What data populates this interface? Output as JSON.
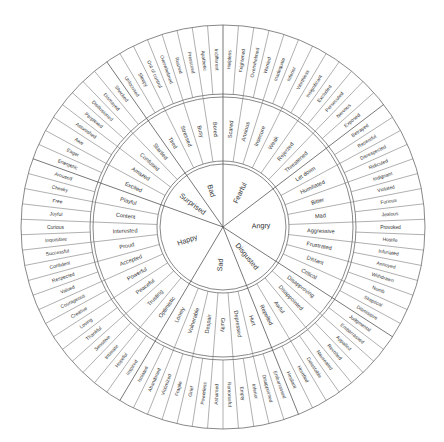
{
  "diagram": {
    "geometry": {
      "cx": 223,
      "cy": 227,
      "r_core": 63,
      "r_mid_inner": 66,
      "r_mid": 130,
      "r_out_inner": 133,
      "r_out": 202,
      "start_angle_deg": -90
    },
    "colors": {
      "line": "#6a6a6a",
      "text": "#333333",
      "background": "#ffffff"
    },
    "core": [
      {
        "label": "Fearful",
        "secondary": [
          {
            "label": "Scared",
            "tertiary": [
              "Helpless",
              "Frightened"
            ]
          },
          {
            "label": "Anxious",
            "tertiary": [
              "Overwhelmed",
              "Worried"
            ]
          },
          {
            "label": "Insecure",
            "tertiary": [
              "Inadequate",
              "Inferior"
            ]
          },
          {
            "label": "Weak",
            "tertiary": [
              "Worthless",
              "Insignificant"
            ]
          },
          {
            "label": "Rejected",
            "tertiary": [
              "Excluded",
              "Persecuted"
            ]
          },
          {
            "label": "Threatened",
            "tertiary": [
              "Nervous",
              "Exposed"
            ]
          }
        ]
      },
      {
        "label": "Angry",
        "secondary": [
          {
            "label": "Let down",
            "tertiary": [
              "Betrayed",
              "Resentful"
            ]
          },
          {
            "label": "Humiliated",
            "tertiary": [
              "Disrespected",
              "Ridiculed"
            ]
          },
          {
            "label": "Bitter",
            "tertiary": [
              "Indignant",
              "Violated"
            ]
          },
          {
            "label": "Mad",
            "tertiary": [
              "Furious",
              "Jealous"
            ]
          },
          {
            "label": "Aggressive",
            "tertiary": [
              "Provoked",
              "Hostile"
            ]
          },
          {
            "label": "Frustrated",
            "tertiary": [
              "Infuriated",
              "Annoyed"
            ]
          },
          {
            "label": "Distant",
            "tertiary": [
              "Withdrawn",
              "Numb"
            ]
          },
          {
            "label": "Critical",
            "tertiary": [
              "Skeptical",
              "Dismissive"
            ]
          }
        ]
      },
      {
        "label": "Disgusted",
        "secondary": [
          {
            "label": "Disapproving",
            "tertiary": [
              "Judgmental",
              "Embarrassed"
            ]
          },
          {
            "label": "Disappointed",
            "tertiary": [
              "Appalled",
              "Revolted"
            ]
          },
          {
            "label": "Awful",
            "tertiary": [
              "Nauseated",
              "Detestable"
            ]
          },
          {
            "label": "Repelled",
            "tertiary": [
              "Horrified",
              "Hesitant"
            ]
          }
        ]
      },
      {
        "label": "Sad",
        "secondary": [
          {
            "label": "Hurt",
            "tertiary": [
              "Embarrassed",
              "Disappointed"
            ]
          },
          {
            "label": "Depressed",
            "tertiary": [
              "Inferior",
              "Empty"
            ]
          },
          {
            "label": "Guilty",
            "tertiary": [
              "Remorseful",
              "Ashamed"
            ]
          },
          {
            "label": "Despair",
            "tertiary": [
              "Powerless",
              "Grief"
            ]
          },
          {
            "label": "Vulnerable",
            "tertiary": [
              "Fragile",
              "Victimized"
            ]
          },
          {
            "label": "Lonely",
            "tertiary": [
              "Abandoned",
              "Isolated"
            ]
          }
        ]
      },
      {
        "label": "Happy",
        "secondary": [
          {
            "label": "Optimistic",
            "tertiary": [
              "Inspired",
              "Hopeful"
            ]
          },
          {
            "label": "Trusting",
            "tertiary": [
              "Intimate",
              "Sensitive"
            ]
          },
          {
            "label": "Peaceful",
            "tertiary": [
              "Thankful",
              "Loving"
            ]
          },
          {
            "label": "Powerful",
            "tertiary": [
              "Creative",
              "Courageous"
            ]
          },
          {
            "label": "Accepted",
            "tertiary": [
              "Valued",
              "Respected"
            ]
          },
          {
            "label": "Proud",
            "tertiary": [
              "Confident",
              "Successful"
            ]
          },
          {
            "label": "Interested",
            "tertiary": [
              "Inquisitive",
              "Curious"
            ]
          },
          {
            "label": "Content",
            "tertiary": [
              "Joyful",
              "Free"
            ]
          },
          {
            "label": "Playful",
            "tertiary": [
              "Cheeky",
              "Aroused"
            ]
          }
        ]
      },
      {
        "label": "Surprised",
        "secondary": [
          {
            "label": "Excited",
            "tertiary": [
              "Energetic",
              "Eager"
            ]
          },
          {
            "label": "Amazed",
            "tertiary": [
              "Awe",
              "Astonished"
            ]
          },
          {
            "label": "Confused",
            "tertiary": [
              "Perplexed",
              "Disillusioned"
            ]
          },
          {
            "label": "Startled",
            "tertiary": [
              "Dismayed",
              "Shocked"
            ]
          }
        ]
      },
      {
        "label": "Bad",
        "secondary": [
          {
            "label": "Tired",
            "tertiary": [
              "Unfocused",
              "Sleepy"
            ]
          },
          {
            "label": "Stressed",
            "tertiary": [
              "Out of control",
              "Overwhelmed"
            ]
          },
          {
            "label": "Busy",
            "tertiary": [
              "Rushed",
              "Pressured"
            ]
          },
          {
            "label": "Bored",
            "tertiary": [
              "Apathetic",
              "Indifferent"
            ]
          }
        ]
      }
    ]
  }
}
